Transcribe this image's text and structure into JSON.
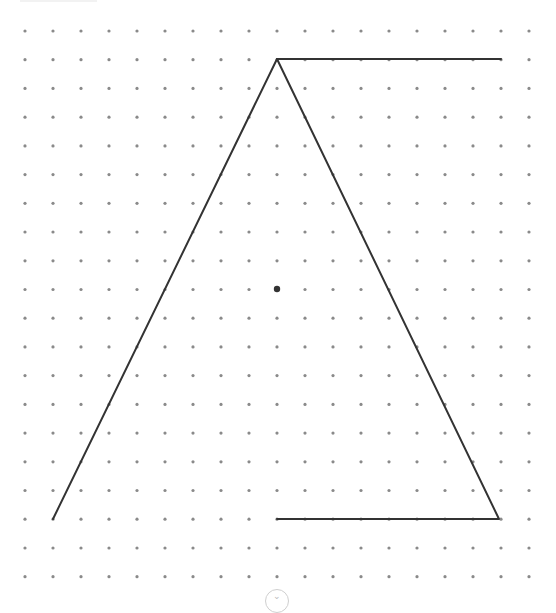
{
  "canvas": {
    "width": 556,
    "height": 601,
    "grid": {
      "x0": 25,
      "dx": 28,
      "cols": 19,
      "y0": 31,
      "dy": 28.72,
      "rows": 20,
      "dot_color": "#8a8a8a",
      "dot_radius": 1.6
    },
    "polyline": {
      "points": [
        [
          53,
          519
        ],
        [
          277,
          59
        ],
        [
          501,
          59
        ]
      ],
      "color": "#333333",
      "width": 2
    },
    "polyline2": {
      "points": [
        [
          277,
          519
        ],
        [
          499,
          519
        ],
        [
          277,
          59
        ]
      ],
      "color": "#333333",
      "width": 2
    },
    "center_point": {
      "x": 277,
      "y": 289,
      "r": 3.2,
      "color": "#333333"
    }
  },
  "scroll_button": {
    "icon": "chevron-down-icon",
    "label": ""
  }
}
